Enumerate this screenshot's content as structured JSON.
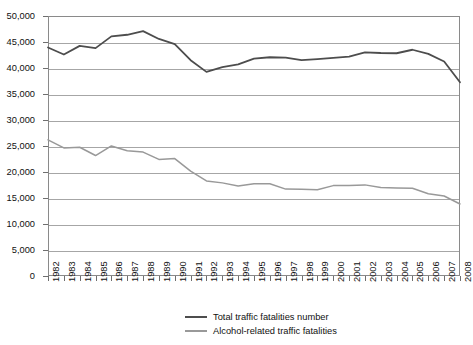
{
  "chart_data": {
    "type": "line",
    "title": "",
    "subtitle": "",
    "xlabel": "",
    "ylabel": "",
    "grid": true,
    "legend_position": "bottom",
    "ylim": [
      0,
      50000
    ],
    "ytick_labels": [
      "50,000",
      "45,000",
      "40,000",
      "35,000",
      "30,000",
      "25,000",
      "20,000",
      "15,000",
      "10,000",
      "5,000",
      "0"
    ],
    "ytick_values": [
      50000,
      45000,
      40000,
      35000,
      30000,
      25000,
      20000,
      15000,
      10000,
      5000,
      0
    ],
    "categories": [
      "1982",
      "1983",
      "1984",
      "1985",
      "1986",
      "1987",
      "1988",
      "1989",
      "1990",
      "1991",
      "1992",
      "1993",
      "1994",
      "1995",
      "1996",
      "1997",
      "1998",
      "1999",
      "2000",
      "2001",
      "2002",
      "2003",
      "2004",
      "2005",
      "2006",
      "2007",
      "2008"
    ],
    "series": [
      {
        "name": "Total traffic fatalities number",
        "color": "#4d4d4d",
        "values": [
          43945,
          42589,
          44257,
          43825,
          46087,
          46390,
          47087,
          45582,
          44599,
          41508,
          39250,
          40150,
          40716,
          41817,
          42065,
          42013,
          41501,
          41717,
          41945,
          42196,
          43005,
          42884,
          42836,
          43510,
          42708,
          41259,
          37261
        ]
      },
      {
        "name": "Alcohol-related traffic fatalities",
        "color": "#999999",
        "values": [
          26173,
          24635,
          24762,
          23167,
          25017,
          24094,
          23833,
          22424,
          22587,
          20159,
          18290,
          17908,
          17308,
          17732,
          17749,
          16711,
          16673,
          16572,
          17380,
          17400,
          17524,
          17013,
          16919,
          16885,
          15829,
          15387,
          13846
        ]
      }
    ],
    "legend": [
      {
        "label": "Total traffic fatalities number",
        "color": "#4d4d4d"
      },
      {
        "label": "Alcohol-related traffic fatalities",
        "color": "#999999"
      }
    ]
  }
}
